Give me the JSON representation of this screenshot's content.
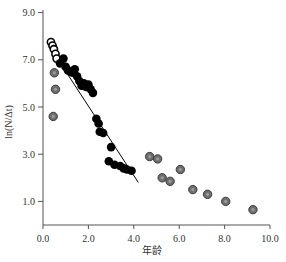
{
  "chart_data": {
    "type": "scatter",
    "title": "",
    "xlabel": "年龄",
    "ylabel": "ln(N/Δt)",
    "xlim": [
      0,
      10
    ],
    "ylim": [
      0,
      9
    ],
    "xticks": [
      "0.0",
      "2.0",
      "4.0",
      "6.0",
      "8.0",
      "10.0"
    ],
    "yticks": [
      "1.0",
      "3.0",
      "5.0",
      "7.0",
      "9.0"
    ],
    "grid": false,
    "legend": null,
    "series": [
      {
        "name": "open",
        "marker": "open-circle",
        "color": "#000000",
        "points": [
          [
            0.35,
            7.75
          ],
          [
            0.42,
            7.6
          ],
          [
            0.48,
            7.45
          ],
          [
            0.55,
            7.25
          ],
          [
            0.6,
            7.05
          ]
        ]
      },
      {
        "name": "filled-black",
        "marker": "filled-circle",
        "color": "#000000",
        "points": [
          [
            0.75,
            6.85
          ],
          [
            0.9,
            7.05
          ],
          [
            1.0,
            6.7
          ],
          [
            1.1,
            6.55
          ],
          [
            1.2,
            6.5
          ],
          [
            1.3,
            6.45
          ],
          [
            1.4,
            6.6
          ],
          [
            1.5,
            6.3
          ],
          [
            1.6,
            6.1
          ],
          [
            1.7,
            5.9
          ],
          [
            1.8,
            6.0
          ],
          [
            1.9,
            5.85
          ],
          [
            2.0,
            5.95
          ],
          [
            2.1,
            5.75
          ],
          [
            2.2,
            5.6
          ],
          [
            2.35,
            4.5
          ],
          [
            2.45,
            4.3
          ],
          [
            2.5,
            3.95
          ],
          [
            2.65,
            3.9
          ],
          [
            2.9,
            2.7
          ],
          [
            3.0,
            3.3
          ],
          [
            3.15,
            2.55
          ],
          [
            3.4,
            2.5
          ],
          [
            3.55,
            2.4
          ],
          [
            3.7,
            2.35
          ],
          [
            3.9,
            2.3
          ]
        ]
      },
      {
        "name": "filled-gray",
        "marker": "gray-circle",
        "color": "#707070",
        "points": [
          [
            0.5,
            6.45
          ],
          [
            0.55,
            5.75
          ],
          [
            0.45,
            4.6
          ],
          [
            4.7,
            2.9
          ],
          [
            5.05,
            2.8
          ],
          [
            5.25,
            2.0
          ],
          [
            5.6,
            1.85
          ],
          [
            6.05,
            2.35
          ],
          [
            6.6,
            1.5
          ],
          [
            7.25,
            1.3
          ],
          [
            8.05,
            1.0
          ],
          [
            9.25,
            0.65
          ]
        ]
      }
    ],
    "regression_line": {
      "x": [
        0.6,
        4.2
      ],
      "y": [
        7.1,
        1.8
      ]
    }
  }
}
